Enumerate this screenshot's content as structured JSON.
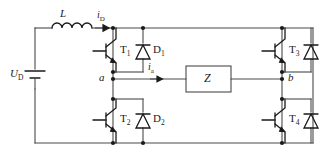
{
  "diagram": {
    "type": "schematic",
    "background_color": "#ffffff",
    "wire_color": "#4a4a4a",
    "device_color": "#1a1a1a"
  },
  "labels": {
    "inductor": "L",
    "source": "U",
    "source_sub": "D",
    "current_dc": "i",
    "current_dc_sub": "D",
    "current_load": "i",
    "current_load_sub": "a",
    "node_a": "a",
    "node_b": "b",
    "load": "Z"
  },
  "transistors": [
    {
      "id": "T1",
      "name": "T",
      "sub": "1",
      "position": "top-left"
    },
    {
      "id": "T2",
      "name": "T",
      "sub": "2",
      "position": "bottom-left"
    },
    {
      "id": "T3",
      "name": "T",
      "sub": "3",
      "position": "top-right"
    },
    {
      "id": "T4",
      "name": "T",
      "sub": "4",
      "position": "bottom-right"
    }
  ],
  "diodes": [
    {
      "id": "D1",
      "name": "D",
      "sub": "1",
      "position": "top-left"
    },
    {
      "id": "D2",
      "name": "D",
      "sub": "2",
      "position": "bottom-left"
    },
    {
      "id": "D3",
      "name": "D",
      "sub": "3",
      "position": "top-right"
    },
    {
      "id": "D4",
      "name": "D",
      "sub": "4",
      "position": "bottom-right"
    }
  ]
}
